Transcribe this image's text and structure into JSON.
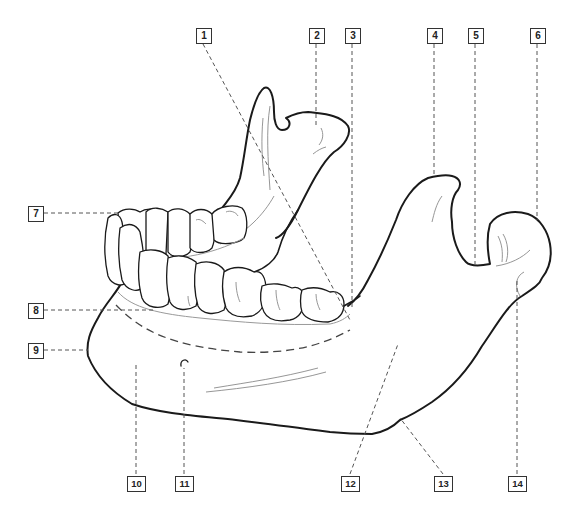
{
  "diagram": {
    "colors": {
      "line": "#1a1a1a",
      "leader": "#555555",
      "background": "#ffffff"
    },
    "labels": [
      {
        "id": "1",
        "text": "1",
        "x": 196,
        "y": 28
      },
      {
        "id": "2",
        "text": "2",
        "x": 309,
        "y": 28
      },
      {
        "id": "3",
        "text": "3",
        "x": 345,
        "y": 28
      },
      {
        "id": "4",
        "text": "4",
        "x": 427,
        "y": 28
      },
      {
        "id": "5",
        "text": "5",
        "x": 468,
        "y": 28
      },
      {
        "id": "6",
        "text": "6",
        "x": 530,
        "y": 28
      },
      {
        "id": "7",
        "text": "7",
        "x": 28,
        "y": 206
      },
      {
        "id": "8",
        "text": "8",
        "x": 28,
        "y": 303
      },
      {
        "id": "9",
        "text": "9",
        "x": 28,
        "y": 343
      },
      {
        "id": "10",
        "text": "10",
        "x": 128,
        "y": 476
      },
      {
        "id": "11",
        "text": "11",
        "x": 176,
        "y": 476
      },
      {
        "id": "12",
        "text": "12",
        "x": 342,
        "y": 476
      },
      {
        "id": "13",
        "text": "13",
        "x": 435,
        "y": 476
      },
      {
        "id": "14",
        "text": "14",
        "x": 509,
        "y": 476
      }
    ]
  }
}
